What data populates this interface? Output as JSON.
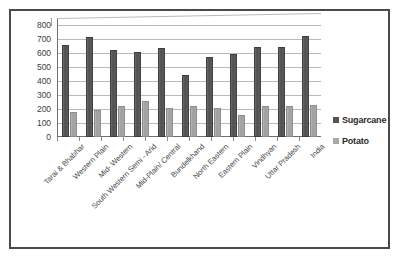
{
  "chart_data": {
    "type": "bar",
    "title": "",
    "xlabel": "",
    "ylabel": "",
    "ylim": [
      0,
      800
    ],
    "yticks": [
      800,
      700,
      600,
      500,
      400,
      300,
      200,
      100,
      0
    ],
    "grid": true,
    "legend_position": "right",
    "categories": [
      "Tarai & Bhabhar",
      "Western Plain",
      "Mid- Western",
      "South Western Semi - Arid",
      "Mid-Plain/ Central",
      "Bundelkhand",
      "North Eastern",
      "Eastern Plain",
      "Vindhyan",
      "Uttar Pradesh",
      "India"
    ],
    "series": [
      {
        "name": "Sugarcane",
        "color": "#555555",
        "values": [
          655,
          715,
          625,
          605,
          635,
          440,
          575,
          595,
          640,
          640,
          720
        ]
      },
      {
        "name": "Potato",
        "color": "#a8a8a8",
        "values": [
          180,
          190,
          220,
          260,
          205,
          220,
          205,
          155,
          220,
          220,
          230
        ]
      }
    ]
  },
  "legend": {
    "items": [
      {
        "label": "Sugarcane",
        "swatch": "sugarcane"
      },
      {
        "label": "Potato",
        "swatch": "potato"
      }
    ]
  }
}
